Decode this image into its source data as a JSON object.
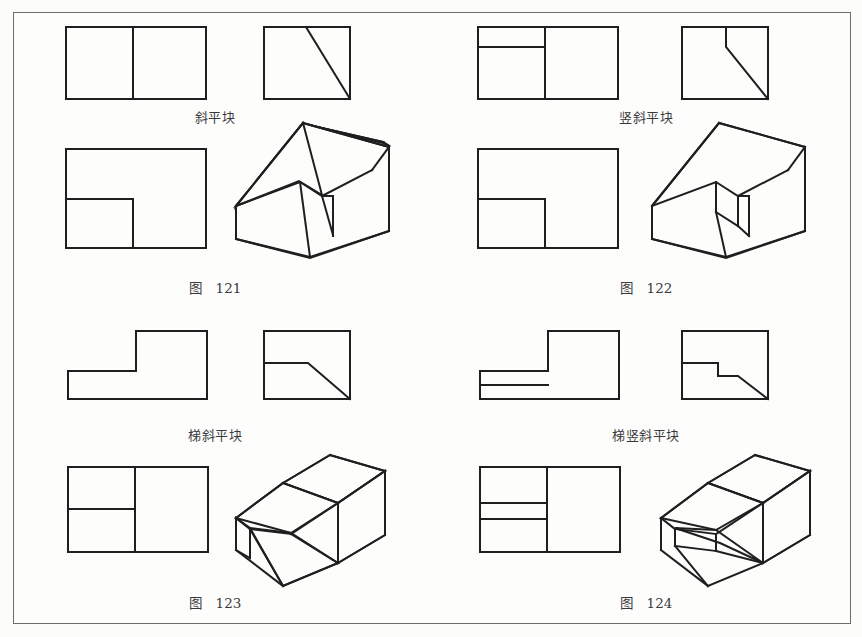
{
  "page": {
    "background_color": "#fcfcfb",
    "border_color": "#6e6e70",
    "line_color": "#1f1f20",
    "text_color": "#3a3a3c"
  },
  "figures": [
    {
      "id": "fig-121",
      "name": "斜平块",
      "fig_word": "图",
      "fig_number": "121",
      "description": "Oblique flat block: rectangular prism with a single inclined plane cut",
      "views": {
        "top_left_view": "rectangle divided by one vertical line",
        "top_right_view": "rectangle with diagonal from top edge to bottom-right corner",
        "front_view": "rectangle with inner L-shaped step line at lower left",
        "pictorial": "isometric block with inclined face"
      }
    },
    {
      "id": "fig-122",
      "name": "竖斜平块",
      "fig_word": "图",
      "fig_number": "122",
      "description": "Vertical-oblique flat block: prism with a vertical face followed by an inclined plane",
      "views": {
        "top_left_view": "rectangle divided by one vertical line plus a horizontal line in the left part",
        "top_right_view": "rectangle with a short vertical line then a diagonal to bottom-right corner",
        "front_view": "rectangle with inner L-shaped step line at lower left",
        "pictorial": "isometric block with vertical riser and inclined face"
      }
    },
    {
      "id": "fig-123",
      "name": "梯斜平块",
      "fig_word": "图",
      "fig_number": "123",
      "description": "Stepped oblique flat block: two-level step with an inclined plane",
      "views": {
        "top_left_view": "L-shaped step outline, low on the left and tall on the right",
        "top_right_view": "square with horizontal line then diagonal to bottom-right corner",
        "front_view": "rectangle divided by a vertical line and a horizontal line at the left",
        "pictorial": "isometric stepped block with inclined face"
      }
    },
    {
      "id": "fig-124",
      "name": "梯竖斜平块",
      "fig_word": "图",
      "fig_number": "124",
      "description": "Stepped vertical-oblique flat block: two-level step with vertical riser and inclined plane",
      "views": {
        "top_left_view": "L-shaped step outline with an extra horizontal line in the low left part",
        "top_right_view": "square with horizontal, small vertical drop, short horizontal, then diagonal to bottom-right corner",
        "front_view": "rectangle divided by a vertical line and two horizontal lines at the left",
        "pictorial": "isometric stepped block with vertical riser and inclined face"
      }
    }
  ]
}
